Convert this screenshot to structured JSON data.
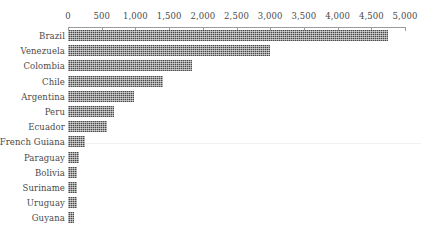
{
  "chart_data": {
    "type": "bar",
    "orientation": "horizontal",
    "title": "",
    "subtitle": "",
    "xlabel": "",
    "ylabel": "",
    "xlim": [
      0,
      5000
    ],
    "grid": false,
    "legend": false,
    "axis_position": "top",
    "categories": [
      "Brazil",
      "Venezuela",
      "Colombia",
      "Chile",
      "Argentina",
      "Peru",
      "Ecuador",
      "French Guiana",
      "Paraguay",
      "Bolivia",
      "Suriname",
      "Uruguay",
      "Guyana"
    ],
    "values": [
      4750,
      3000,
      1840,
      1410,
      980,
      680,
      580,
      250,
      160,
      130,
      130,
      130,
      90
    ],
    "tick_labels": [
      "0",
      "500",
      "1,000",
      "1,500",
      "2,000",
      "2,500",
      "3,000",
      "3,500",
      "4,000",
      "4,500",
      "5,000"
    ],
    "tick_values": [
      0,
      500,
      1000,
      1500,
      2000,
      2500,
      3000,
      3500,
      4000,
      4500,
      5000
    ],
    "colors": {
      "bar_fill": "#4a4a4a",
      "axis": "#9a9a9a",
      "text": "#4a4a4a",
      "background": "#ffffff"
    }
  }
}
